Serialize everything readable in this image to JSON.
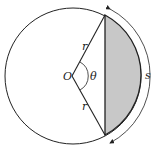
{
  "diagram": {
    "type": "circle-segment",
    "labels": {
      "center": "O",
      "radius_top": "r",
      "radius_bottom": "r",
      "angle": "θ",
      "arc": "s"
    },
    "colors": {
      "stroke": "#222222",
      "shade": "#c8c8c8",
      "background": "#ffffff"
    }
  }
}
